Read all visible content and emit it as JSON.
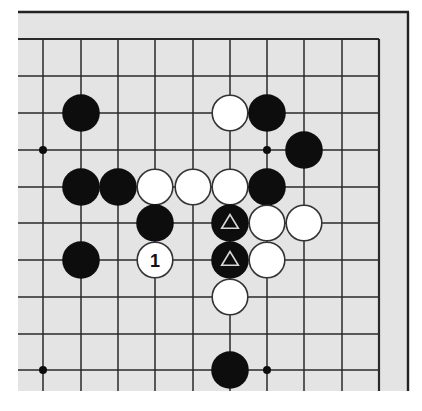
{
  "diagram": {
    "type": "go-board-fragment",
    "colors": {
      "page_background": "#ffffff",
      "board_background": "#e4e4e4",
      "grid_line": "#2a2a2a",
      "edge_line": "#222222",
      "black_stone": "#0d0d0d",
      "white_stone": "#ffffff",
      "white_stone_border": "#333333",
      "triangle_marker": "#d8d8d8",
      "label_text": "#111111"
    },
    "geometry": {
      "board_rect": {
        "x": 18,
        "y": 11,
        "width": 391,
        "height": 380
      },
      "frame_top_y": 12,
      "frame_right_x": 408,
      "grid_columns_x": [
        43,
        81,
        118,
        155,
        193,
        230,
        267,
        304,
        342,
        379
      ],
      "grid_rows_y": [
        39,
        76,
        113,
        150,
        187,
        223,
        260,
        297,
        334,
        370
      ],
      "grid_left_extent_x": 18,
      "grid_bottom_extent_y": 391,
      "right_edge_column_index": 9,
      "top_edge_row_index": 0,
      "stone_radius": 18.2,
      "hoshi_radius": 4
    },
    "hoshi": [
      {
        "col": 0,
        "row": 3
      },
      {
        "col": 6,
        "row": 3
      },
      {
        "col": 0,
        "row": 9
      },
      {
        "col": 6,
        "row": 9
      }
    ],
    "stones": [
      {
        "color": "black",
        "col": 1,
        "row": 2
      },
      {
        "color": "white",
        "col": 5,
        "row": 2
      },
      {
        "color": "black",
        "col": 6,
        "row": 2
      },
      {
        "color": "black",
        "col": 7,
        "row": 3
      },
      {
        "color": "black",
        "col": 1,
        "row": 4
      },
      {
        "color": "black",
        "col": 2,
        "row": 4
      },
      {
        "color": "white",
        "col": 3,
        "row": 4
      },
      {
        "color": "white",
        "col": 4,
        "row": 4
      },
      {
        "color": "white",
        "col": 5,
        "row": 4
      },
      {
        "color": "black",
        "col": 6,
        "row": 4
      },
      {
        "color": "black",
        "col": 3,
        "row": 5
      },
      {
        "color": "black",
        "col": 5,
        "row": 5,
        "marker": "triangle"
      },
      {
        "color": "white",
        "col": 6,
        "row": 5
      },
      {
        "color": "white",
        "col": 7,
        "row": 5
      },
      {
        "color": "black",
        "col": 1,
        "row": 6
      },
      {
        "color": "white",
        "col": 3,
        "row": 6,
        "label": "1"
      },
      {
        "color": "black",
        "col": 5,
        "row": 6,
        "marker": "triangle"
      },
      {
        "color": "white",
        "col": 6,
        "row": 6
      },
      {
        "color": "white",
        "col": 5,
        "row": 7
      },
      {
        "color": "black",
        "col": 5,
        "row": 9
      }
    ]
  }
}
